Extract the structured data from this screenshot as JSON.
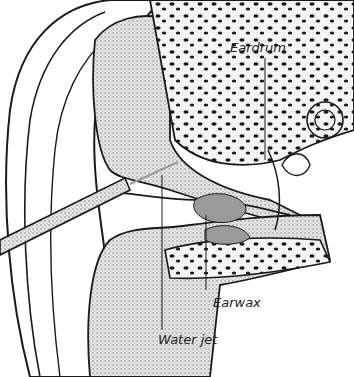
{
  "diagram": {
    "labels": {
      "eardrum": "Eardrum",
      "earwax": "Earwax",
      "water_jet": "Water jet"
    }
  },
  "colors": {
    "line": "#1a1a1a",
    "tissue_fill": "#d9d9d9",
    "bone_fill": "#f2f2f2",
    "syringe_fill": "#cfcfcf",
    "background": "#ffffff"
  }
}
